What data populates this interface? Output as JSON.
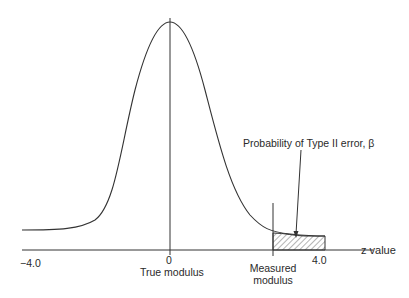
{
  "diagram": {
    "type": "normal-distribution-type-ii-error",
    "axis": {
      "label": "z value",
      "ticks": [
        {
          "label": "−4.0",
          "x": 32
        },
        {
          "label": "0",
          "x": 170
        },
        {
          "label": "4.0",
          "x": 318
        }
      ]
    },
    "markers": {
      "true_modulus": "True modulus",
      "measured_modulus_line1": "Measured",
      "measured_modulus_line2": "modulus"
    },
    "annotation": {
      "text": "Probability of Type II error, β"
    },
    "colors": {
      "line": "#333333",
      "background": "#ffffff"
    }
  }
}
